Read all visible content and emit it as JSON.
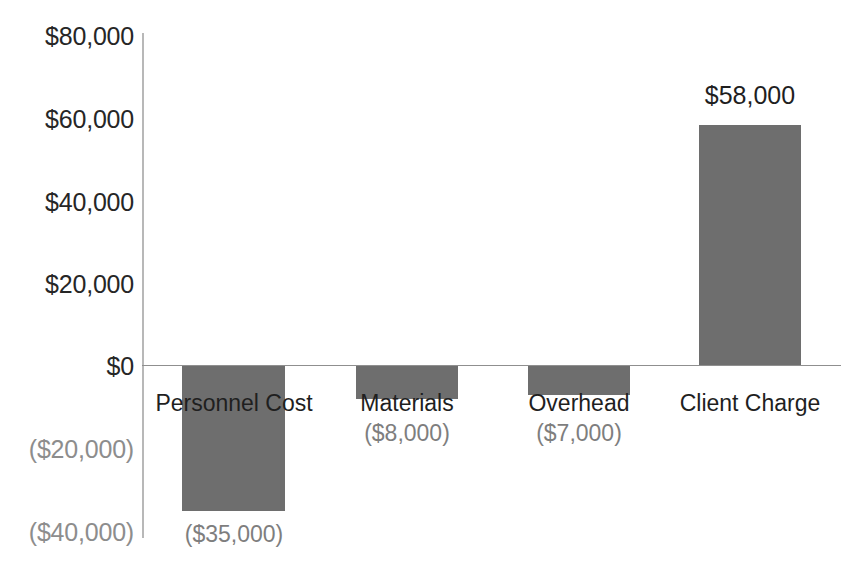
{
  "chart_data": {
    "type": "bar",
    "title": "",
    "subtitle": "",
    "xlabel": "",
    "ylabel": "",
    "categories": [
      "Personnel Cost",
      "Materials",
      "Overhead",
      "Client Charge"
    ],
    "values": [
      -35000,
      -8000,
      -7000,
      58000
    ],
    "value_labels": [
      "($35,000)",
      "($8,000)",
      "($7,000)",
      "$58,000"
    ],
    "ylim": [
      -40000,
      80000
    ],
    "yticks": [
      80000,
      60000,
      40000,
      20000,
      0,
      -20000,
      -40000
    ],
    "ytick_labels": [
      "$80,000",
      "$60,000",
      "$40,000",
      "$20,000",
      "$0",
      "($20,000)",
      "($40,000)"
    ],
    "grid": false,
    "legend": null,
    "legend_position": "none",
    "bar_color": "#6e6e6e",
    "axis_color": "#b8b8b8",
    "zero_line_color": "#8f8f8f",
    "positive_label_color": "#1f1f1f",
    "negative_label_color": "#7e7e7e",
    "category_label_color": "#1f1f1f"
  }
}
